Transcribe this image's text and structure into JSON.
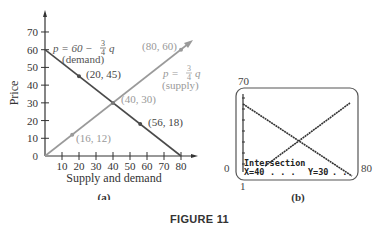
{
  "figure_label": "FIGURE 11",
  "chart_data": [
    {
      "type": "line",
      "panel_label": "(a)",
      "title": "",
      "xlabel": "Supply and demand",
      "ylabel": "Price",
      "xlim": [
        0,
        80
      ],
      "ylim": [
        0,
        70
      ],
      "xticks": [
        "10",
        "20",
        "30",
        "40",
        "50",
        "60",
        "70",
        "80"
      ],
      "yticks": [
        "10",
        "20",
        "30",
        "40",
        "50",
        "60",
        "70"
      ],
      "origin_label": "0",
      "grid": false,
      "series": [
        {
          "name": "demand",
          "equation": "p = 60 − 3/4 q",
          "label": "(demand)",
          "color": "#4a4a4a",
          "x": [
            0,
            80
          ],
          "y": [
            60,
            0
          ]
        },
        {
          "name": "supply",
          "equation": "p = 3/4 q",
          "label": "(supply)",
          "color": "#9a9a9a",
          "x": [
            0,
            80
          ],
          "y": [
            0,
            60
          ]
        }
      ],
      "points": [
        {
          "label": "(20, 45)",
          "x": 20,
          "y": 45,
          "series": "demand"
        },
        {
          "label": "(56, 18)",
          "x": 56,
          "y": 18,
          "series": "demand"
        },
        {
          "label": "(40, 30)",
          "x": 40,
          "y": 30,
          "series": "intersection"
        },
        {
          "label": "(16, 12)",
          "x": 16,
          "y": 12,
          "series": "supply"
        },
        {
          "label": "(80, 60)",
          "x": 80,
          "y": 60,
          "series": "supply"
        }
      ],
      "annotations": {
        "demand_eq_p": "p = 60 − ",
        "demand_eq_num": "3",
        "demand_eq_den": "4",
        "demand_eq_q": "q",
        "demand_label": "(demand)",
        "supply_eq_p": "p = ",
        "supply_eq_num": "3",
        "supply_eq_den": "4",
        "supply_eq_q": "q",
        "supply_label": "(supply)"
      }
    },
    {
      "type": "line",
      "panel_label": "(b)",
      "title": "Graphing calculator screen",
      "window": {
        "xmin": "0",
        "xmax": "80",
        "ymin": "1",
        "ymax": "70"
      },
      "series": [
        {
          "name": "demand",
          "x": [
            0,
            80
          ],
          "y": [
            60,
            0
          ]
        },
        {
          "name": "supply",
          "x": [
            0,
            80
          ],
          "y": [
            0,
            60
          ]
        }
      ],
      "intersection": {
        "label": "Intersection",
        "x_text": "X=40",
        "y_text": "Y=30",
        "x": 40,
        "y": 30
      }
    }
  ]
}
